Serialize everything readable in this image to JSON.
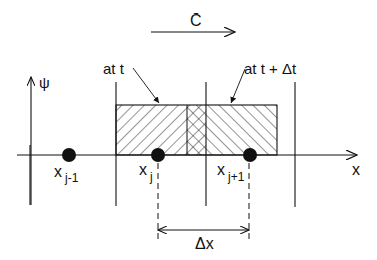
{
  "diagram": {
    "velocity_label": "C̄",
    "psi_axis_label": "ψ",
    "x_axis_label": "x",
    "label_at_t": "at t",
    "label_at_t_dt": "at t + Δt",
    "nodes": [
      {
        "base": "x",
        "sub": "j-1"
      },
      {
        "base": "x",
        "sub": "j"
      },
      {
        "base": "x",
        "sub": "j+1"
      }
    ],
    "spacing_label": "Δx",
    "colors": {
      "ink": "#111111",
      "background": "#ffffff"
    }
  }
}
